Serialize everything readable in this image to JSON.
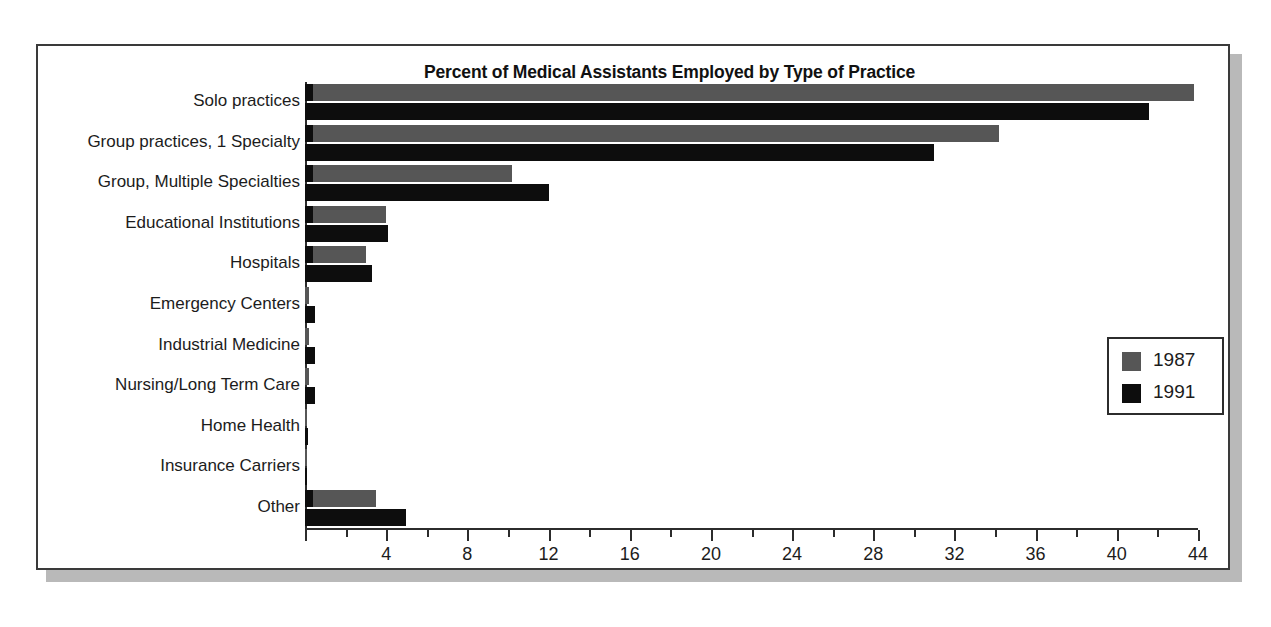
{
  "figure": {
    "background_color": "#ffffff",
    "frame_border_color": "#3a3a3a",
    "shadow_color": "#b9b9b9"
  },
  "chart_data": {
    "type": "bar",
    "orientation": "horizontal",
    "title": "Percent of Medical Assistants Employed by Type of Practice",
    "subtitle": "",
    "xlabel": "",
    "ylabel": "",
    "xlim": [
      0,
      44
    ],
    "ylim": null,
    "grid": false,
    "legend_position": "right",
    "xticks": [
      0,
      4,
      8,
      12,
      16,
      20,
      24,
      28,
      32,
      36,
      40,
      44
    ],
    "xtick_labels": [
      "",
      "4",
      "8",
      "12",
      "16",
      "20",
      "24",
      "28",
      "32",
      "36",
      "40",
      "44"
    ],
    "minor_tick_interval": 2,
    "categories": [
      "Solo practices",
      "Group practices, 1 Specialty",
      "Group, Multiple Specialties",
      "Educational Institutions",
      "Hospitals",
      "Emergency Centers",
      "Industrial Medicine",
      "Nursing/Long Term Care",
      "Home Health",
      "Insurance Carriers",
      "Other"
    ],
    "series": [
      {
        "name": "1987",
        "color": "#565656",
        "values": [
          43.8,
          34.2,
          10.2,
          4.0,
          3.0,
          0.2,
          0.2,
          0.2,
          0.1,
          0.1,
          3.5
        ]
      },
      {
        "name": "1991",
        "color": "#0d0d0d",
        "values": [
          41.6,
          31.0,
          12.0,
          4.1,
          3.3,
          0.5,
          0.5,
          0.5,
          0.15,
          0.1,
          5.0
        ]
      }
    ]
  },
  "legend": {
    "entries": [
      {
        "label": "1987",
        "color": "#565656"
      },
      {
        "label": "1991",
        "color": "#0d0d0d"
      }
    ]
  }
}
